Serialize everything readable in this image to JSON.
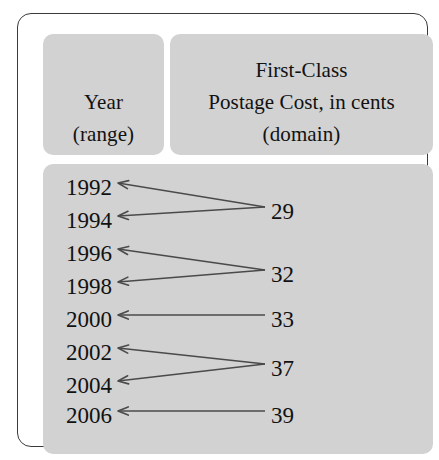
{
  "diagram": {
    "title_left_line1": "Year",
    "title_left_line2": "(range)",
    "title_right_line1": "First-Class",
    "title_right_line2": "Postage Cost, in cents",
    "title_right_line3": "(domain)",
    "panel_color": "#d2d2d2",
    "border_color": "#3a3a3a",
    "text_color": "#111111",
    "arrow_color": "#4a4a4a"
  },
  "chart_data": {
    "type": "diagram",
    "title": "First-Class Postage Cost, in cents",
    "xlabel": "First-Class Postage Cost, in cents (domain)",
    "ylabel": "Year (range)",
    "mapping_direction": "domain-to-range",
    "domain": [
      29,
      32,
      33,
      37,
      39
    ],
    "range": [
      1992,
      1994,
      1996,
      1998,
      2000,
      2002,
      2004,
      2006
    ],
    "pairs": [
      {
        "value": "29",
        "years": [
          "1992",
          "1994"
        ]
      },
      {
        "value": "32",
        "years": [
          "1996",
          "1998"
        ]
      },
      {
        "value": "33",
        "years": [
          "2000"
        ]
      },
      {
        "value": "37",
        "years": [
          "2002",
          "2004"
        ]
      },
      {
        "value": "39",
        "years": [
          "2006"
        ]
      }
    ],
    "years": [
      {
        "label": "1992",
        "y": 184,
        "value": "29"
      },
      {
        "label": "1994",
        "y": 217,
        "value": "29"
      },
      {
        "label": "1996",
        "y": 250,
        "value": "32"
      },
      {
        "label": "1998",
        "y": 283,
        "value": "32"
      },
      {
        "label": "2000",
        "y": 316,
        "value": "33"
      },
      {
        "label": "2002",
        "y": 349,
        "value": "37"
      },
      {
        "label": "2004",
        "y": 382,
        "value": "37"
      },
      {
        "label": "2006",
        "y": 412,
        "value": "39"
      }
    ],
    "values": [
      {
        "label": "29",
        "y": 208
      },
      {
        "label": "32",
        "y": 271
      },
      {
        "label": "33",
        "y": 316
      },
      {
        "label": "37",
        "y": 365
      },
      {
        "label": "39",
        "y": 412
      }
    ]
  }
}
